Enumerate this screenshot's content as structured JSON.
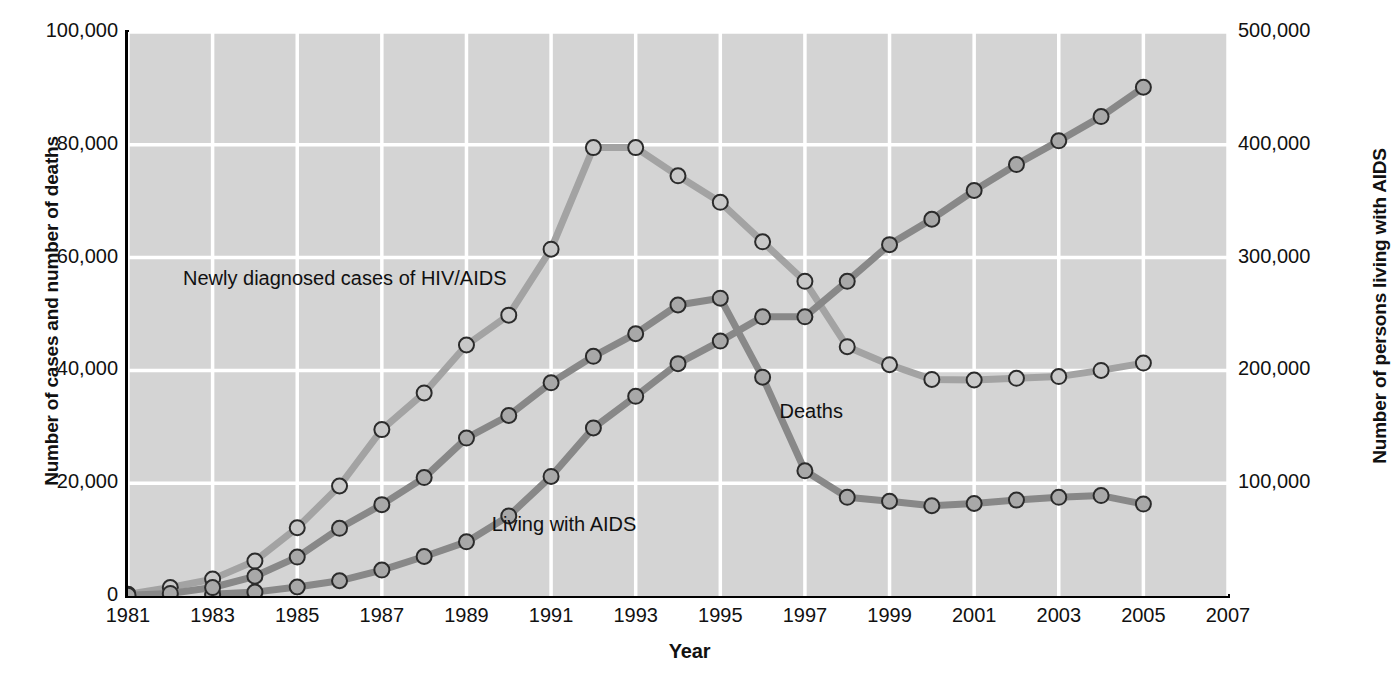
{
  "chart_data": {
    "type": "line",
    "title": "",
    "xlabel": "Year",
    "ylabel": "Number of cases and number of deaths",
    "ylabel_right": "Number of persons living with AIDS",
    "xlim": [
      1981,
      2007
    ],
    "ylim": [
      0,
      100000
    ],
    "ylim_right": [
      0,
      500000
    ],
    "grid": true,
    "legend_position": "inline-annotations",
    "x": [
      1981,
      1982,
      1983,
      1984,
      1985,
      1986,
      1987,
      1988,
      1989,
      1990,
      1991,
      1992,
      1993,
      1994,
      1995,
      1996,
      1997,
      1998,
      1999,
      2000,
      2001,
      2002,
      2003,
      2004,
      2005
    ],
    "xticks": [
      "1981",
      "1983",
      "1985",
      "1987",
      "1989",
      "1991",
      "1993",
      "1995",
      "1997",
      "1999",
      "2001",
      "2003",
      "2005",
      "2007"
    ],
    "yticks_left": [
      "0",
      "20,000",
      "40,000",
      "60,000",
      "80,000",
      "100,000"
    ],
    "yticks_right": [
      "100,000",
      "200,000",
      "300,000",
      "400,000",
      "500,000"
    ],
    "series": [
      {
        "name": "Newly diagnosed cases of HIV/AIDS",
        "axis": "left",
        "color": "#a3a3a3",
        "marker_fill": "#c9c9c9",
        "values": [
          300,
          1500,
          3000,
          6200,
          12100,
          19500,
          29500,
          36000,
          44500,
          49800,
          61500,
          79500,
          79500,
          74500,
          69800,
          62800,
          55800,
          44200,
          41000,
          38400,
          38300,
          38600,
          38900,
          40000,
          41300
        ]
      },
      {
        "name": "Deaths",
        "axis": "left",
        "color": "#888888",
        "marker_fill": "#a8a8a8",
        "values": [
          130,
          460,
          1500,
          3500,
          6900,
          12000,
          16200,
          21000,
          28000,
          32000,
          37800,
          42500,
          46500,
          51600,
          52800,
          38800,
          22200,
          17500,
          16800,
          16000,
          16400,
          17000,
          17500,
          17800,
          16300
        ]
      },
      {
        "name": "Living with AIDS",
        "axis": "left",
        "right_scale_values": [
          1500,
          3500,
          8000,
          13500,
          23000,
          35000,
          52000,
          74000,
          104000,
          141000,
          180000,
          226000,
          274000,
          318000,
          354000,
          400000,
          435000,
          471000
        ],
        "color": "#888888",
        "marker_fill": "#a8a8a8",
        "values": [
          null,
          null,
          300,
          700,
          1600,
          2700,
          4600,
          7000,
          9600,
          14200,
          21200,
          29800,
          35400,
          41200,
          45200,
          49500,
          49500,
          55800,
          62300,
          66800,
          71900,
          76500,
          80700,
          85000,
          90200
        ]
      },
      {
        "name": "Living with AIDS continued",
        "axis": "right",
        "color": "#888888",
        "marker_fill": "#a8a8a8",
        "values_right_axis_last": 470000
      }
    ],
    "annotations": [
      {
        "text": "Newly diagnosed cases of HIV/AIDS",
        "x": 1982.3,
        "y": 56000
      },
      {
        "text": "Deaths",
        "x": 1996.4,
        "y": 32500
      },
      {
        "text": "Living with AIDS",
        "x": 1989.6,
        "y": 12500
      }
    ]
  },
  "axes": {
    "left_title": "Number of cases and number of deaths",
    "right_title": "Number of persons living with AIDS",
    "x_title": "Year"
  },
  "colors": {
    "plot_background": "#d4d4d4",
    "gridline": "#ffffff",
    "axis": "#000000",
    "series_light": "#a3a3a3",
    "series_dark": "#888888"
  },
  "caption": ""
}
